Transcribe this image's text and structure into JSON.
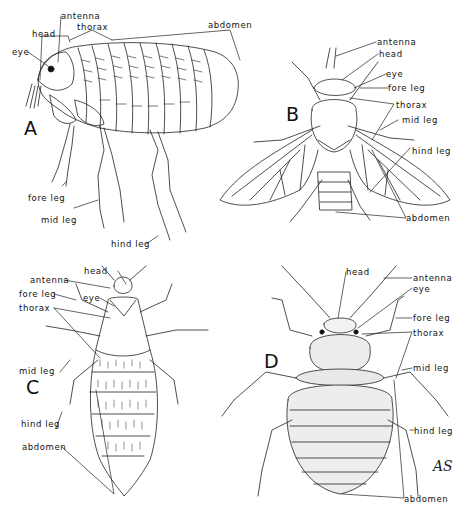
{
  "figure": {
    "panels": [
      {
        "id": "A",
        "letter": "A",
        "subject": "flea (lateral view)",
        "labels": {
          "antenna": "antenna",
          "thorax": "thorax",
          "abdomen": "abdomen",
          "head": "head",
          "eye": "eye",
          "fore_leg": "fore leg",
          "mid_leg": "mid leg",
          "hind_leg": "hind leg"
        }
      },
      {
        "id": "B",
        "letter": "B",
        "subject": "fly (dorsal view)",
        "labels": {
          "antenna": "antenna",
          "head": "head",
          "eye": "eye",
          "fore_leg": "fore leg",
          "thorax": "thorax",
          "mid_leg": "mid leg",
          "hind_leg": "hind leg",
          "abdomen": "abdomen"
        }
      },
      {
        "id": "C",
        "letter": "C",
        "subject": "louse (dorsal view)",
        "labels": {
          "head": "head",
          "antenna": "antenna",
          "fore_leg": "fore leg",
          "eye": "eye",
          "thorax": "thorax",
          "mid_leg": "mid leg",
          "hind_leg": "hind leg",
          "abdomen": "abdomen"
        }
      },
      {
        "id": "D",
        "letter": "D",
        "subject": "bed bug (dorsal view)",
        "labels": {
          "head": "head",
          "antenna": "antenna",
          "eye": "eye",
          "fore_leg": "fore leg",
          "thorax": "thorax",
          "mid_leg": "mid leg",
          "hind_leg": "hind leg",
          "abdomen": "abdomen"
        }
      }
    ],
    "signature": "AS"
  }
}
